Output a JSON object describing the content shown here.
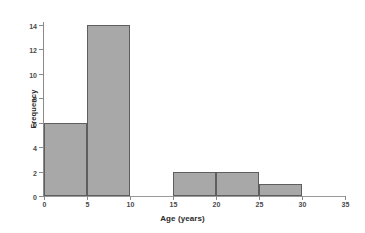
{
  "chart_data": {
    "type": "bar",
    "title": "",
    "xlabel": "Age (years)",
    "ylabel": "Frequency",
    "xlim": [
      0,
      35
    ],
    "ylim": [
      0,
      14
    ],
    "grid": false,
    "legend": false,
    "bin_width": 5,
    "bin_edges": [
      0,
      5,
      10,
      15,
      20,
      25,
      30,
      35
    ],
    "categories": [
      "0-5",
      "5-10",
      "10-15",
      "15-20",
      "20-25",
      "25-30",
      "30-35"
    ],
    "values": [
      6,
      14,
      0,
      2,
      2,
      1,
      0
    ],
    "xticks": [
      {
        "value": 0,
        "label": "0"
      },
      {
        "value": 5,
        "label": "5"
      },
      {
        "value": 10,
        "label": "10"
      },
      {
        "value": 15,
        "label": "15"
      },
      {
        "value": 20,
        "label": "20"
      },
      {
        "value": 25,
        "label": "25"
      },
      {
        "value": 30,
        "label": "30"
      },
      {
        "value": 35,
        "label": "35"
      }
    ],
    "yticks": [
      {
        "value": 0,
        "label": "0"
      },
      {
        "value": 2,
        "label": "2"
      },
      {
        "value": 4,
        "label": "4"
      },
      {
        "value": 6,
        "label": "6"
      },
      {
        "value": 8,
        "label": "8"
      },
      {
        "value": 10,
        "label": "10"
      },
      {
        "value": 12,
        "label": "12"
      },
      {
        "value": 14,
        "label": "14"
      }
    ],
    "bars": [
      {
        "label": "0-5",
        "x0": 0,
        "x1": 5,
        "value": 6
      },
      {
        "label": "5-10",
        "x0": 5,
        "x1": 10,
        "value": 14
      },
      {
        "label": "10-15",
        "x0": 10,
        "x1": 15,
        "value": 0
      },
      {
        "label": "15-20",
        "x0": 15,
        "x1": 20,
        "value": 2
      },
      {
        "label": "20-25",
        "x0": 20,
        "x1": 25,
        "value": 2
      },
      {
        "label": "25-30",
        "x0": 25,
        "x1": 30,
        "value": 1
      },
      {
        "label": "30-35",
        "x0": 30,
        "x1": 35,
        "value": 0
      }
    ],
    "colors": {
      "bar_fill": "#a8a8a8",
      "bar_edge": "#5e5e5e",
      "axis": "#8a8a8a",
      "text": "#2b2b2b",
      "background": "#ffffff"
    }
  }
}
